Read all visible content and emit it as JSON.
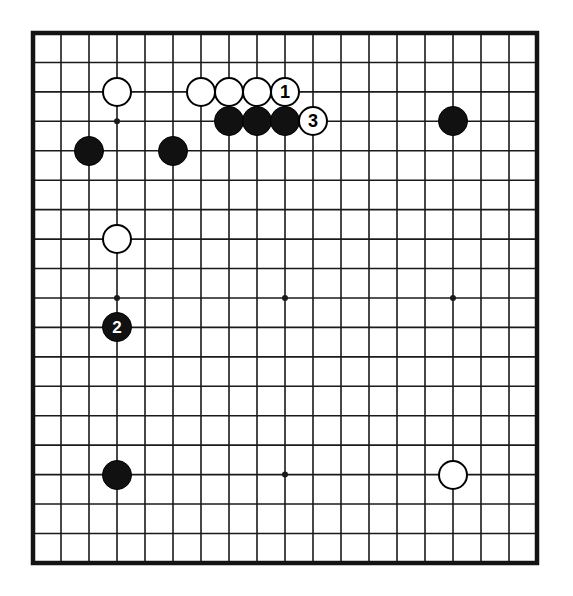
{
  "diagram": {
    "type": "go-board-diagram",
    "board_size": 19,
    "title": "",
    "colors": {
      "board_background": "#ffffff",
      "line": "#1a1a1a",
      "black_stone": "#111111",
      "white_stone": "#ffffff",
      "stone_outline": "#000000",
      "black_label_text": "#ffffff",
      "white_label_text": "#000000"
    },
    "geometry": {
      "left": 33,
      "top": 33,
      "right": 537,
      "bottom": 563,
      "cell_width": 28,
      "cell_height": 29.44,
      "stone_diameter": 30,
      "border_width": 4.5,
      "line_width": 1.6,
      "star_radius": 3
    },
    "star_points": [
      {
        "col": 4,
        "row": 4
      },
      {
        "col": 10,
        "row": 4
      },
      {
        "col": 16,
        "row": 4
      },
      {
        "col": 4,
        "row": 10
      },
      {
        "col": 10,
        "row": 10
      },
      {
        "col": 16,
        "row": 10
      },
      {
        "col": 4,
        "row": 16
      },
      {
        "col": 10,
        "row": 16
      },
      {
        "col": 16,
        "row": 16
      }
    ],
    "stones": [
      {
        "id": "w-d17",
        "color": "white",
        "col": 4,
        "row": 3,
        "label": ""
      },
      {
        "id": "b-c15",
        "color": "black",
        "col": 3,
        "row": 5,
        "label": ""
      },
      {
        "id": "b-f15",
        "color": "black",
        "col": 6,
        "row": 5,
        "label": ""
      },
      {
        "id": "w-g17",
        "color": "white",
        "col": 7,
        "row": 3,
        "label": ""
      },
      {
        "id": "w-h17",
        "color": "white",
        "col": 8,
        "row": 3,
        "label": ""
      },
      {
        "id": "w-j17",
        "color": "white",
        "col": 9,
        "row": 3,
        "label": ""
      },
      {
        "id": "w-k17",
        "color": "white",
        "col": 10,
        "row": 3,
        "label": "1"
      },
      {
        "id": "b-h16",
        "color": "black",
        "col": 8,
        "row": 4,
        "label": ""
      },
      {
        "id": "b-j16",
        "color": "black",
        "col": 9,
        "row": 4,
        "label": ""
      },
      {
        "id": "b-k16",
        "color": "black",
        "col": 10,
        "row": 4,
        "label": ""
      },
      {
        "id": "w-l16",
        "color": "white",
        "col": 11,
        "row": 4,
        "label": "3"
      },
      {
        "id": "b-q16",
        "color": "black",
        "col": 16,
        "row": 4,
        "label": ""
      },
      {
        "id": "w-d12",
        "color": "white",
        "col": 4,
        "row": 8,
        "label": ""
      },
      {
        "id": "b-d9",
        "color": "black",
        "col": 4,
        "row": 11,
        "label": "2"
      },
      {
        "id": "b-d4",
        "color": "black",
        "col": 4,
        "row": 16,
        "label": ""
      },
      {
        "id": "w-q4",
        "color": "white",
        "col": 16,
        "row": 16,
        "label": ""
      }
    ],
    "move_markers": [
      {
        "number": "1",
        "color": "white",
        "col": 10,
        "row": 3
      },
      {
        "number": "2",
        "color": "black",
        "col": 4,
        "row": 11
      },
      {
        "number": "3",
        "color": "white",
        "col": 11,
        "row": 4
      }
    ]
  }
}
